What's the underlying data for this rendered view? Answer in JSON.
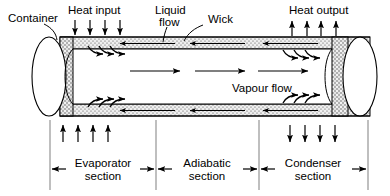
{
  "diagram": {
    "type": "cross-sectional schematic of a heat pipe",
    "colors": {
      "line": "#000000",
      "wick_fill": "#e8e8e8",
      "wick_stipple": "#555555",
      "section_rule": "#777777",
      "background": "#ffffff"
    },
    "callouts": [
      {
        "id": "container",
        "label": "Container",
        "lines": [
          "Container"
        ]
      },
      {
        "id": "heat-input",
        "label": "Heat input",
        "lines": [
          "Heat input"
        ]
      },
      {
        "id": "liquid-flow",
        "label": "Liquid flow",
        "lines": [
          "Liquid",
          "flow"
        ]
      },
      {
        "id": "wick",
        "label": "Wick",
        "lines": [
          "Wick"
        ]
      },
      {
        "id": "heat-output",
        "label": "Heat output",
        "lines": [
          "Heat output"
        ]
      },
      {
        "id": "vapour-flow",
        "label": "Vapour flow",
        "lines": [
          "Vapour flow"
        ]
      }
    ],
    "sections": [
      {
        "id": "evaporator",
        "lines": [
          "Evaporator",
          "section"
        ],
        "label": "Evaporator section"
      },
      {
        "id": "adiabatic",
        "lines": [
          "Adiabatic",
          "section"
        ],
        "label": "Adiabatic section"
      },
      {
        "id": "condenser",
        "lines": [
          "Condenser",
          "section"
        ],
        "label": "Condenser section"
      }
    ],
    "arrow_groups": {
      "heat_input": {
        "direction": "down",
        "count": 4,
        "location": "top-left, into evaporator"
      },
      "heat_output": {
        "direction": "up",
        "count": 4,
        "location": "top-right, out of condenser"
      },
      "heat_input_bottom": {
        "direction": "up",
        "count": 4,
        "location": "below evaporator"
      },
      "heat_output_bottom": {
        "direction": "down",
        "count": 4,
        "location": "below condenser"
      },
      "liquid_flow": {
        "direction": "left",
        "count": 3,
        "location": "within wick band"
      },
      "vapour_flow": {
        "direction": "right",
        "count": 3,
        "location": "core of pipe"
      },
      "evaporation": {
        "direction": "up-right",
        "count": 3,
        "location": "evaporator wick to core"
      },
      "condensation": {
        "direction": "down-right",
        "count": 3,
        "location": "core to condenser wick"
      }
    }
  }
}
